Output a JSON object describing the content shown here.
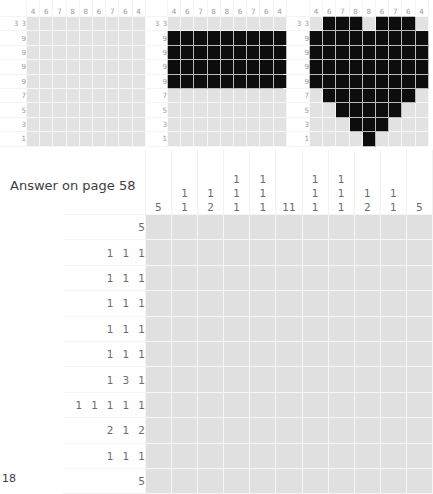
{
  "document": {
    "page_number": "18",
    "answer_note": "Answer on page 58"
  },
  "examples": [
    {
      "name": "example-empty-grid",
      "col_clues": [
        [
          "4"
        ],
        [
          "6"
        ],
        [
          "7"
        ],
        [
          "8"
        ],
        [
          "8"
        ],
        [
          "6"
        ],
        [
          "7"
        ],
        [
          "6"
        ],
        [
          "4"
        ]
      ],
      "row_clues": [
        [
          "3",
          "3"
        ],
        [
          "9"
        ],
        [
          "9"
        ],
        [
          "9"
        ],
        [
          "9"
        ],
        [
          "7"
        ],
        [
          "5"
        ],
        [
          "3"
        ],
        [
          "1"
        ]
      ],
      "cells": [
        [
          0,
          0,
          0,
          0,
          0,
          0,
          0,
          0,
          0
        ],
        [
          0,
          0,
          0,
          0,
          0,
          0,
          0,
          0,
          0
        ],
        [
          0,
          0,
          0,
          0,
          0,
          0,
          0,
          0,
          0
        ],
        [
          0,
          0,
          0,
          0,
          0,
          0,
          0,
          0,
          0
        ],
        [
          0,
          0,
          0,
          0,
          0,
          0,
          0,
          0,
          0
        ],
        [
          0,
          0,
          0,
          0,
          0,
          0,
          0,
          0,
          0
        ],
        [
          0,
          0,
          0,
          0,
          0,
          0,
          0,
          0,
          0
        ],
        [
          0,
          0,
          0,
          0,
          0,
          0,
          0,
          0,
          0
        ],
        [
          0,
          0,
          0,
          0,
          0,
          0,
          0,
          0,
          0
        ]
      ]
    },
    {
      "name": "example-partial-grid",
      "col_clues": [
        [
          "4"
        ],
        [
          "6"
        ],
        [
          "7"
        ],
        [
          "8"
        ],
        [
          "8"
        ],
        [
          "6"
        ],
        [
          "7"
        ],
        [
          "6"
        ],
        [
          "4"
        ]
      ],
      "row_clues": [
        [
          "3",
          "3"
        ],
        [
          "9"
        ],
        [
          "9"
        ],
        [
          "9"
        ],
        [
          "9"
        ],
        [
          "7"
        ],
        [
          "5"
        ],
        [
          "3"
        ],
        [
          "1"
        ]
      ],
      "cells": [
        [
          0,
          0,
          0,
          0,
          0,
          0,
          0,
          0,
          0
        ],
        [
          1,
          1,
          1,
          1,
          1,
          1,
          1,
          1,
          1
        ],
        [
          1,
          1,
          1,
          1,
          1,
          1,
          1,
          1,
          1
        ],
        [
          1,
          1,
          1,
          1,
          1,
          1,
          1,
          1,
          1
        ],
        [
          1,
          1,
          1,
          1,
          1,
          1,
          1,
          1,
          1
        ],
        [
          0,
          0,
          0,
          0,
          0,
          0,
          0,
          0,
          0
        ],
        [
          0,
          0,
          0,
          0,
          0,
          0,
          0,
          0,
          0
        ],
        [
          0,
          0,
          0,
          0,
          0,
          0,
          0,
          0,
          0
        ],
        [
          0,
          0,
          0,
          0,
          0,
          0,
          0,
          0,
          0
        ]
      ]
    },
    {
      "name": "example-solved-grid-heart",
      "col_clues": [
        [
          "4"
        ],
        [
          "6"
        ],
        [
          "7"
        ],
        [
          "8"
        ],
        [
          "8"
        ],
        [
          "6"
        ],
        [
          "7"
        ],
        [
          "6"
        ],
        [
          "4"
        ]
      ],
      "row_clues": [
        [
          "3",
          "3"
        ],
        [
          "9"
        ],
        [
          "9"
        ],
        [
          "9"
        ],
        [
          "9"
        ],
        [
          "7"
        ],
        [
          "5"
        ],
        [
          "3"
        ],
        [
          "1"
        ]
      ],
      "cells": [
        [
          0,
          1,
          1,
          1,
          0,
          1,
          1,
          1,
          0
        ],
        [
          1,
          1,
          1,
          1,
          1,
          1,
          1,
          1,
          1
        ],
        [
          1,
          1,
          1,
          1,
          1,
          1,
          1,
          1,
          1
        ],
        [
          1,
          1,
          1,
          1,
          1,
          1,
          1,
          1,
          1
        ],
        [
          1,
          1,
          1,
          1,
          1,
          1,
          1,
          1,
          1
        ],
        [
          0,
          1,
          1,
          1,
          1,
          1,
          1,
          1,
          0
        ],
        [
          0,
          0,
          1,
          1,
          1,
          1,
          1,
          0,
          0
        ],
        [
          0,
          0,
          0,
          1,
          1,
          1,
          0,
          0,
          0
        ],
        [
          0,
          0,
          0,
          0,
          1,
          0,
          0,
          0,
          0
        ]
      ]
    }
  ],
  "main_puzzle": {
    "name": "main-nonogram",
    "columns": 11,
    "rows": 11,
    "col_clues": [
      [
        "5"
      ],
      [
        "1",
        "1"
      ],
      [
        "1",
        "2"
      ],
      [
        "1",
        "1",
        "1"
      ],
      [
        "1",
        "1",
        "1"
      ],
      [
        "11"
      ],
      [
        "1",
        "1",
        "1"
      ],
      [
        "1",
        "1",
        "1"
      ],
      [
        "1",
        "2"
      ],
      [
        "1",
        "1"
      ],
      [
        "5"
      ]
    ],
    "row_clues": [
      [
        "5"
      ],
      [
        "1",
        "1",
        "1"
      ],
      [
        "1",
        "1",
        "1"
      ],
      [
        "1",
        "1",
        "1"
      ],
      [
        "1",
        "1",
        "1"
      ],
      [
        "1",
        "1",
        "1"
      ],
      [
        "1",
        "3",
        "1"
      ],
      [
        "1",
        "1",
        "1",
        "1",
        "1"
      ],
      [
        "2",
        "1",
        "2"
      ],
      [
        "1",
        "1",
        "1"
      ],
      [
        "5"
      ]
    ]
  },
  "colors": {
    "cell_empty": "#e0e0e0",
    "cell_filled": "#0d0d0d",
    "grid_line": "#f6f6f6",
    "clue_text": "#6b6b6b",
    "note_text": "#3d3d3d",
    "page_background": "#ffffff"
  }
}
